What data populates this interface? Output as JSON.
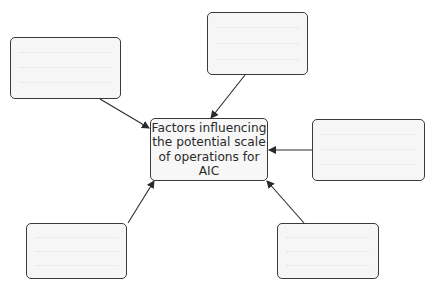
{
  "diagram": {
    "center": {
      "lines": [
        "Factors influencing",
        "the potential scale",
        "of operations for AIC"
      ]
    },
    "satellite_boxes": [
      {
        "id": "top-left",
        "text": ""
      },
      {
        "id": "top",
        "text": ""
      },
      {
        "id": "right",
        "text": ""
      },
      {
        "id": "bottom-left",
        "text": ""
      },
      {
        "id": "bottom-right",
        "text": ""
      }
    ],
    "colors": {
      "stroke": "#3a3a3a",
      "fill": "#f6f6f6"
    }
  }
}
